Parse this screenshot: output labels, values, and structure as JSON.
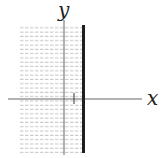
{
  "figure": {
    "type": "inequality-graph",
    "inequality": "x ≤ 1",
    "x_axis_label": "x",
    "y_axis_label": "y",
    "boundary": {
      "x": 1,
      "style": "solid"
    },
    "shaded_side": "left",
    "tick_marks": [
      {
        "axis": "x",
        "value": 1
      }
    ],
    "colors": {
      "axis": "#555555",
      "boundary": "#222222",
      "shade": "#bbbbbb"
    }
  }
}
